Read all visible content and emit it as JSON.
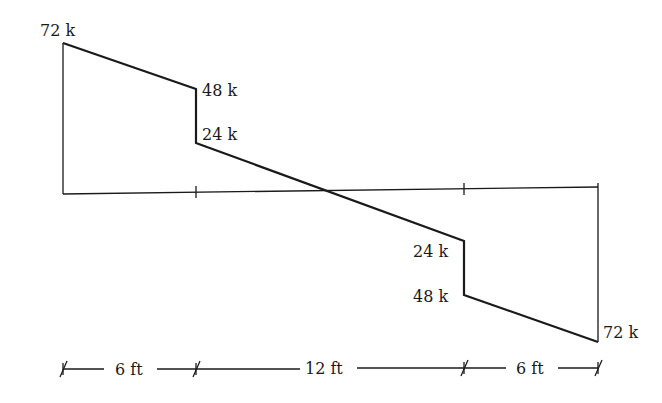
{
  "diagram": {
    "type": "shear-force-diagram",
    "labels": {
      "left_top": "72 k",
      "left_step_top": "48 k",
      "left_step_bottom": "24 k",
      "right_step_top": "24 k",
      "right_step_bottom": "48 k",
      "right_bottom": "72 k"
    },
    "dimensions": {
      "seg1": "6 ft",
      "seg2": "12 ft",
      "seg3": "6 ft"
    },
    "shear_values_k": [
      72,
      48,
      24,
      -24,
      -48,
      -72
    ],
    "segment_lengths_ft": [
      6,
      12,
      6
    ],
    "colors": {
      "line": "#1a1a1a",
      "background": "#ffffff"
    }
  }
}
